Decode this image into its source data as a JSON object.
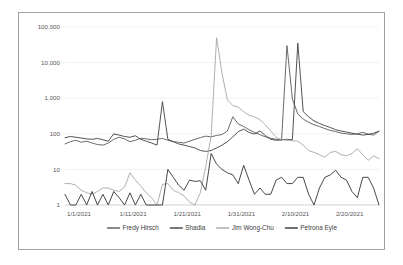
{
  "chart_data": {
    "type": "line",
    "title": "",
    "xlabel": "",
    "ylabel": "",
    "yscale": "log",
    "ylim": [
      1,
      100000
    ],
    "grid": true,
    "legend_position": "bottom",
    "y_ticks": [
      "1",
      "10",
      "100",
      "1,000",
      "10,000",
      "100,000"
    ],
    "y_tick_values": [
      1,
      10,
      100,
      1000,
      10000,
      100000
    ],
    "x_ticks": [
      "1/1/2021",
      "1/11/2021",
      "1/21/2021",
      "1/31/2021",
      "2/10/2021",
      "2/20/2021"
    ],
    "x_tick_indices": [
      0,
      10,
      20,
      30,
      40,
      50
    ],
    "x_count": 59,
    "series": [
      {
        "name": "Fredy Hirsch",
        "color": "#595959",
        "values": [
          52,
          60,
          66,
          58,
          62,
          55,
          50,
          48,
          55,
          70,
          80,
          72,
          60,
          66,
          75,
          72,
          68,
          70,
          74,
          66,
          60,
          58,
          55,
          62,
          70,
          78,
          86,
          82,
          90,
          95,
          120,
          300,
          190,
          160,
          130,
          110,
          95,
          82,
          75,
          70,
          66,
          30000,
          950,
          360,
          260,
          210,
          180,
          160,
          140,
          125,
          115,
          105,
          100,
          96,
          100,
          110,
          98,
          92,
          118
        ]
      },
      {
        "name": "Shadia",
        "color": "#404040",
        "values": [
          78,
          84,
          80,
          76,
          72,
          70,
          74,
          68,
          62,
          100,
          92,
          84,
          80,
          88,
          70,
          62,
          55,
          48,
          800,
          70,
          60,
          52,
          48,
          44,
          40,
          34,
          32,
          34,
          40,
          48,
          60,
          82,
          115,
          135,
          110,
          98,
          120,
          90,
          70,
          66,
          68,
          70,
          68,
          35000,
          420,
          300,
          230,
          195,
          170,
          150,
          130,
          120,
          112,
          104,
          98,
          92,
          96,
          104,
          118
        ]
      },
      {
        "name": "Jim Wong-Chu",
        "color": "#a6a6a6",
        "values": [
          4,
          4,
          3.6,
          2.6,
          2.2,
          2,
          2.4,
          3,
          3,
          2.6,
          2.4,
          3.2,
          8,
          5,
          3.4,
          2.2,
          1.6,
          1,
          3.8,
          4,
          2.6,
          2.2,
          1.8,
          1.2,
          1,
          2.2,
          12,
          90,
          50000,
          5000,
          900,
          620,
          560,
          420,
          330,
          300,
          250,
          180,
          120,
          80,
          68,
          66,
          64,
          62,
          48,
          34,
          30,
          26,
          22,
          30,
          32,
          26,
          24,
          28,
          38,
          26,
          18,
          24,
          20
        ]
      },
      {
        "name": "Petrona Eyle",
        "color": "#333333",
        "values": [
          2,
          1,
          1,
          2,
          1,
          2.4,
          1,
          2,
          1,
          2.4,
          1.6,
          1,
          2.2,
          1,
          2,
          1,
          1,
          1,
          1,
          10,
          6,
          3.6,
          2.6,
          5,
          4.6,
          4.8,
          2.6,
          28,
          14,
          10,
          8,
          7,
          4,
          13,
          5,
          2,
          3,
          2,
          2,
          5,
          6,
          4,
          4,
          6,
          6,
          2,
          1,
          3,
          6,
          7,
          9.5,
          6,
          5,
          2.4,
          1.6,
          6,
          6,
          3,
          1
        ]
      }
    ]
  },
  "legend": {
    "entries": [
      {
        "label": "Fredy Hirsch",
        "color": "#595959"
      },
      {
        "label": "Shadia",
        "color": "#404040"
      },
      {
        "label": "Jim Wong-Chu",
        "color": "#a6a6a6"
      },
      {
        "label": "Petrona Eyle",
        "color": "#333333"
      }
    ]
  }
}
